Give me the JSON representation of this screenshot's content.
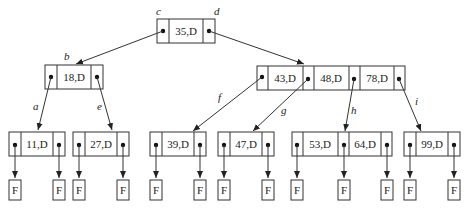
{
  "diagram": {
    "type": "B-tree",
    "root": {
      "keys": [
        "35,D"
      ],
      "pointer_labels": [
        "c",
        "d"
      ]
    },
    "level1": [
      {
        "keys": [
          "18,D"
        ],
        "edge_label": "b"
      },
      {
        "keys": [
          "43,D",
          "48,D",
          "78,D"
        ],
        "edge_label": "d"
      }
    ],
    "leaves": [
      {
        "keys": [
          "11,D"
        ],
        "edge_label": "a"
      },
      {
        "keys": [
          "27,D"
        ],
        "edge_label": "e"
      },
      {
        "keys": [
          "39,D"
        ],
        "edge_label": "f"
      },
      {
        "keys": [
          "47,D"
        ],
        "edge_label": "g"
      },
      {
        "keys": [
          "53,D",
          "64,D"
        ],
        "edge_label": "h"
      },
      {
        "keys": [
          "99,D"
        ],
        "edge_label": "i"
      }
    ],
    "fail_label": "F",
    "edge_labels": {
      "a": "a",
      "b": "b",
      "c": "c",
      "d": "d",
      "e": "e",
      "f": "f",
      "g": "g",
      "h": "h",
      "i": "i"
    }
  }
}
